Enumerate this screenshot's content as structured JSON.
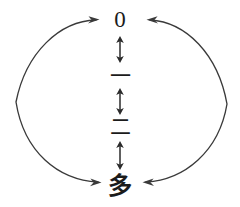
{
  "diagram": {
    "background_color": "#ffffff",
    "stroke_color": "#333333",
    "text_color": "#1b1b1b",
    "nodes": [
      {
        "id": "zero",
        "label": "0",
        "meaning": "zero"
      },
      {
        "id": "one",
        "label": "一",
        "meaning": "one"
      },
      {
        "id": "two",
        "label": "二",
        "meaning": "two"
      },
      {
        "id": "many",
        "label": "多",
        "meaning": "many"
      }
    ],
    "vertical_connectors": [
      {
        "id": "zero-one",
        "type": "double-arrow",
        "from": "zero",
        "to": "one"
      },
      {
        "id": "one-two",
        "type": "double-arrow",
        "from": "one",
        "to": "two"
      },
      {
        "id": "two-many",
        "type": "double-arrow",
        "from": "two",
        "to": "many"
      }
    ],
    "arcs": [
      {
        "id": "left-arc",
        "type": "double-arrow-arc",
        "side": "left",
        "from": "many",
        "to": "zero"
      },
      {
        "id": "right-arc",
        "type": "double-arrow-arc",
        "side": "right",
        "from": "zero",
        "to": "many"
      }
    ]
  }
}
